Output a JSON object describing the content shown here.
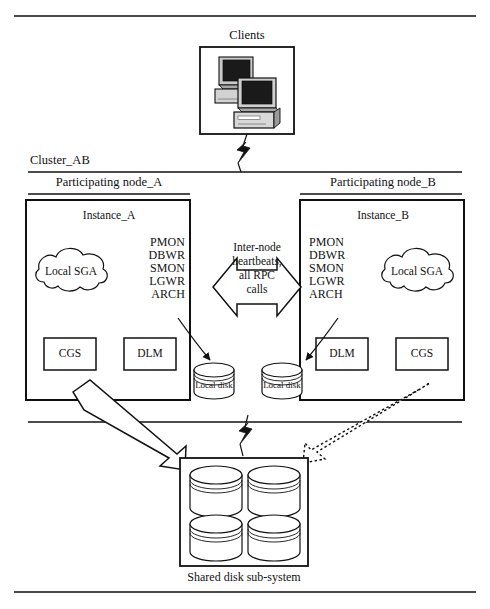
{
  "diagram": {
    "title_clients": "Clients",
    "cluster_label": "Cluster_AB",
    "shared_disk_label": "Shared disk sub-system",
    "interconnect_text_lines": [
      "Inter-node",
      "heartbeats,",
      "all RPC",
      "calls"
    ],
    "interconnect_text": "Inter-node heartbeats, all RPC calls",
    "colors": {
      "line": "#111111",
      "background": "#ffffff",
      "monitor_screen": "#1a1a1a",
      "monitor_body": "#c9c9c9",
      "monitor_shadow": "#8a8a8a"
    },
    "nodes": [
      {
        "node_label": "Participating node_A",
        "instance_label": "Instance_A",
        "sga_label": "Local SGA",
        "processes": [
          "PMON",
          "DBWR",
          "SMON",
          "LGWR",
          "ARCH"
        ],
        "components": [
          "CGS",
          "DLM"
        ],
        "local_disk_label": "Local disk"
      },
      {
        "node_label": "Participating node_B",
        "instance_label": "Instance_B",
        "sga_label": "Local SGA",
        "processes": [
          "PMON",
          "DBWR",
          "SMON",
          "LGWR",
          "ARCH"
        ],
        "components": [
          "DLM",
          "CGS"
        ],
        "local_disk_label": "Local disk"
      }
    ],
    "icons": {
      "clients": "computer-workstation-icon",
      "lightning_top": "lightning-bolt-icon",
      "lightning_bottom": "lightning-bolt-icon",
      "sga": "cloud-icon",
      "local_disk": "disk-cylinder-icon",
      "shared_disk": "disk-cylinder-icon",
      "solid_arrow": "block-arrow-icon",
      "dotted_arrow": "dotted-block-arrow-icon",
      "interconnect": "double-headed-block-arrow-icon"
    }
  }
}
